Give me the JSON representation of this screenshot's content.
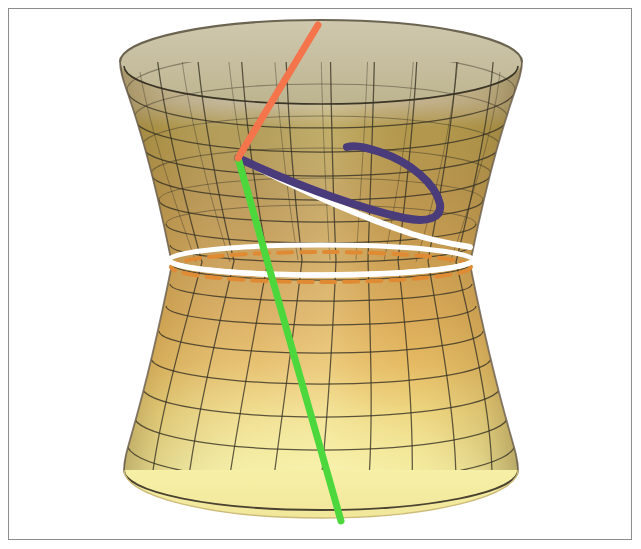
{
  "figure": {
    "kind": "3d-surface-plot",
    "surface_name": "hyperboloid-of-one-sheet",
    "title": "",
    "caption": "",
    "background_color": "#ffffff",
    "frame": {
      "visible": true,
      "color": "#8d8d8d",
      "x": 8,
      "y": 8,
      "width": 624,
      "height": 532
    }
  },
  "chart_data": {
    "type": "surface3d",
    "title": "",
    "subtitle": "",
    "xlabel": "",
    "ylabel": "",
    "zlabel": "",
    "grid": true,
    "legend_position": "none",
    "surface": {
      "name": "hyperboloid-of-one-sheet",
      "equation": "x^2 + y^2 - z^2 = 1",
      "waist_center_x": 321,
      "waist_center_y": 264,
      "waist_radius_x": 150,
      "waist_radius_y": 15,
      "top_radius_x": 201,
      "top_radius_y": 42,
      "top_center_y": 62,
      "bottom_radius_x": 197,
      "bottom_radius_y": 48,
      "bottom_center_y": 470,
      "u_lines": 24,
      "v_lines": 18,
      "gridline_color": "#3a3526",
      "colors": {
        "top_back_inner": "#c9c2a8",
        "top_front_olive": "#ab9448",
        "mid_tan": "#c79a4e",
        "mid_orange": "#dda857",
        "lower_light": "#f0e79a",
        "bottom_rim": "#f4efa3",
        "bottom_shadow": "#e0a860",
        "silhouette_edge": "#6e6250"
      }
    },
    "curves": [
      {
        "name": "orange-ruling-line",
        "label": "straight ruling (orange)",
        "color": "#f4744c",
        "stroke_width": 7,
        "style": "solid",
        "shape": "line",
        "points": [
          [
            318,
            25
          ],
          [
            238,
            158
          ]
        ]
      },
      {
        "name": "green-ruling-line",
        "label": "straight ruling (green)",
        "color": "#4cd83c",
        "stroke_width": 7,
        "style": "solid",
        "shape": "line",
        "points": [
          [
            238,
            158
          ],
          [
            277,
            300
          ],
          [
            303,
            400
          ],
          [
            341,
            521
          ]
        ]
      },
      {
        "name": "purple-geodesic-curve",
        "label": "geodesic (purple)",
        "color": "#4a3b7a",
        "stroke_width": 8,
        "style": "solid",
        "shape": "curve",
        "points": [
          [
            238,
            158
          ],
          [
            300,
            186
          ],
          [
            360,
            208
          ],
          [
            412,
            219
          ],
          [
            437,
            209
          ],
          [
            424,
            186
          ],
          [
            390,
            163
          ],
          [
            347,
            148
          ]
        ]
      },
      {
        "name": "white-geodesic-curve",
        "label": "geodesic (white)",
        "color": "#ffffff",
        "stroke_width": 6,
        "style": "solid",
        "shape": "curve",
        "points": [
          [
            238,
            158
          ],
          [
            300,
            193
          ],
          [
            370,
            222
          ],
          [
            430,
            238
          ],
          [
            468,
            246
          ]
        ]
      },
      {
        "name": "white-waist-circle",
        "label": "throat circle (white)",
        "color": "#ffffff",
        "stroke_width": 5,
        "style": "solid",
        "shape": "ellipse",
        "center": [
          321,
          260
        ],
        "radius_x": 152,
        "radius_y": 15
      },
      {
        "name": "orange-waist-circle",
        "label": "throat circle (orange, dashed)",
        "color": "#e08a33",
        "stroke_width": 4,
        "style": "dashed",
        "dash_pattern": "14 9",
        "shape": "ellipse",
        "center": [
          321,
          267
        ],
        "radius_x": 150,
        "radius_y": 15
      }
    ],
    "annotations": [
      {
        "name": "curve-intersection-point",
        "label": "common point of all curves",
        "x": 238,
        "y": 158
      }
    ]
  }
}
